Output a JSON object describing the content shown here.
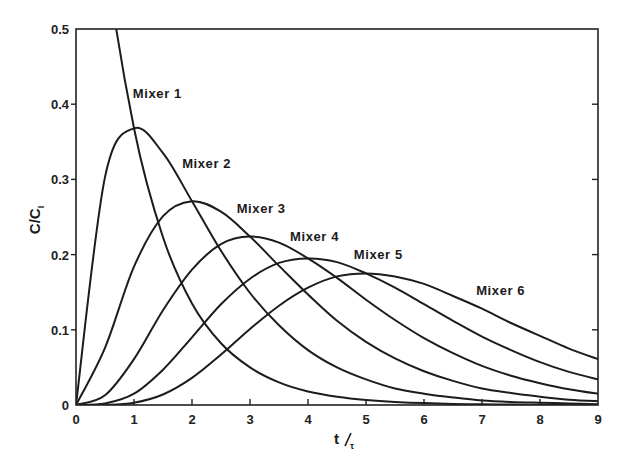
{
  "chart_data": {
    "type": "line",
    "title": "",
    "xlabel": "t/τ",
    "xlabel_parts": {
      "main": "t",
      "sub": "τ"
    },
    "ylabel": "C/C_I",
    "ylabel_parts": {
      "main": "C/C",
      "sub": "I"
    },
    "xlim": [
      0,
      9
    ],
    "ylim": [
      0,
      0.5
    ],
    "xticks": [
      "0",
      "1",
      "2",
      "3",
      "4",
      "5",
      "6",
      "7",
      "8",
      "9"
    ],
    "yticks": [
      "0",
      "0.1",
      "0.2",
      "0.3",
      "0.4",
      "0.5"
    ],
    "grid": false,
    "legend": "inline labels",
    "x": [
      0,
      0.5,
      1,
      1.5,
      2,
      2.5,
      3,
      3.5,
      4,
      4.5,
      5,
      5.5,
      6,
      6.5,
      7,
      7.5,
      8,
      8.5,
      9
    ],
    "series": [
      {
        "name": "Mixer 1",
        "label_pos": [
          0.98,
          0.408
        ],
        "values": [
          1.0,
          0.607,
          0.368,
          0.223,
          0.135,
          0.082,
          0.05,
          0.03,
          0.018,
          0.011,
          0.0067,
          0.0041,
          0.0025,
          0.0015,
          0.0009,
          0.0006,
          0.0003,
          0.0002,
          0.0001
        ]
      },
      {
        "name": "Mixer 2",
        "label_pos": [
          1.83,
          0.315
        ],
        "values": [
          0,
          0.303,
          0.368,
          0.335,
          0.271,
          0.205,
          0.149,
          0.106,
          0.073,
          0.05,
          0.034,
          0.022,
          0.015,
          0.01,
          0.006,
          0.004,
          0.003,
          0.002,
          0.001
        ]
      },
      {
        "name": "Mixer 3",
        "label_pos": [
          2.77,
          0.255
        ],
        "values": [
          0,
          0.076,
          0.184,
          0.251,
          0.271,
          0.257,
          0.224,
          0.185,
          0.147,
          0.112,
          0.084,
          0.062,
          0.045,
          0.032,
          0.022,
          0.016,
          0.011,
          0.007,
          0.005
        ]
      },
      {
        "name": "Mixer 4",
        "label_pos": [
          3.69,
          0.218
        ],
        "values": [
          0,
          0.013,
          0.061,
          0.126,
          0.18,
          0.214,
          0.224,
          0.216,
          0.195,
          0.169,
          0.14,
          0.113,
          0.089,
          0.069,
          0.052,
          0.039,
          0.029,
          0.021,
          0.015
        ]
      },
      {
        "name": "Mixer 5",
        "label_pos": [
          4.79,
          0.194
        ],
        "values": [
          0,
          0.002,
          0.015,
          0.047,
          0.09,
          0.134,
          0.168,
          0.189,
          0.195,
          0.19,
          0.175,
          0.156,
          0.134,
          0.112,
          0.091,
          0.073,
          0.057,
          0.044,
          0.034
        ]
      },
      {
        "name": "Mixer 6",
        "label_pos": [
          6.9,
          0.146
        ],
        "values": [
          0,
          0.0002,
          0.003,
          0.014,
          0.036,
          0.067,
          0.101,
          0.132,
          0.156,
          0.171,
          0.175,
          0.171,
          0.161,
          0.145,
          0.128,
          0.109,
          0.092,
          0.075,
          0.061
        ]
      }
    ]
  },
  "colors": {
    "line": "#1c1c1c",
    "background": "#ffffff"
  }
}
